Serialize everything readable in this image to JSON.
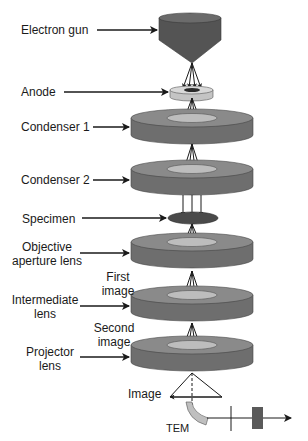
{
  "diagram": {
    "colors": {
      "background": "#ffffff",
      "gun_top": "#6b6b6b",
      "gun_body": "#545454",
      "anode": "#cdcdcd",
      "lens_top": "#8a8a8a",
      "lens_side": "#6e6e6e",
      "lens_hole": "#bdbdbd",
      "specimen": "#4a4a4a",
      "detector": "#bfbfbf",
      "screen": "#5a5a5a",
      "line": "#1a1a1a"
    },
    "labels": {
      "electron_gun": "Electron gun",
      "anode": "Anode",
      "condenser_1": "Condenser 1",
      "condenser_2": "Condenser 2",
      "specimen": "Specimen",
      "objective_line1": "Objective",
      "objective_line2": "aperture lens",
      "first_image_line1": "First",
      "first_image_line2": "image",
      "intermediate_line1": "Intermediate",
      "intermediate_line2": "lens",
      "second_image_line1": "Second",
      "second_image_line2": "image",
      "projector_line1": "Projector",
      "projector_line2": "lens",
      "image": "Image",
      "tem": "TEM"
    }
  }
}
